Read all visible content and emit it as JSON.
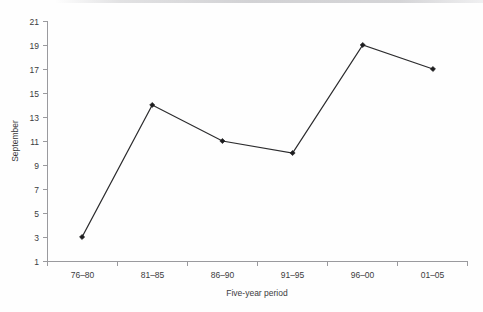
{
  "chart_data": {
    "type": "line",
    "title": "",
    "categories": [
      "76–80",
      "81–85",
      "86–90",
      "91–95",
      "96–00",
      "01–05"
    ],
    "values": [
      3,
      14,
      11,
      10,
      19,
      17
    ],
    "series": [
      {
        "name": "September",
        "values": [
          3,
          14,
          11,
          10,
          19,
          17
        ]
      }
    ],
    "xlabel": "Five-year period",
    "ylabel": "September",
    "ylim": [
      1,
      21
    ],
    "yticks": [
      1,
      3,
      5,
      7,
      9,
      11,
      13,
      15,
      17,
      19,
      21
    ],
    "ytick_labels": [
      "1",
      "3",
      "5",
      "7",
      "9",
      "11",
      "13",
      "15",
      "17",
      "19",
      "21"
    ],
    "grid": false,
    "legend": false,
    "legend_position": "none",
    "marker": "diamond",
    "line_color": "#2b2b2d",
    "marker_color": "#1d1d1f",
    "axis_color": "#9a9a9e",
    "background_color": "#ffffff"
  }
}
